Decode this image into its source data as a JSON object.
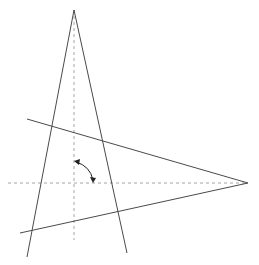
{
  "diagram": {
    "type": "geometric-figure",
    "colors": {
      "solid_line": "#4a4a4a",
      "dashed_line": "#9a9a9a",
      "arrow": "#222222",
      "background": "#ffffff"
    },
    "shapes": {
      "vertical_triangle": {
        "apex": [
          74,
          10
        ],
        "left_base": [
          27,
          257
        ],
        "right_base": [
          127,
          253
        ]
      },
      "horizontal_triangle": {
        "apex": [
          248,
          183
        ],
        "upper_end": [
          27,
          119
        ],
        "lower_end": [
          20,
          233
        ]
      },
      "vertical_axis": {
        "from": [
          74,
          10
        ],
        "to": [
          74,
          240
        ]
      },
      "horizontal_axis": {
        "from": [
          8,
          183
        ],
        "to": [
          248,
          183
        ]
      },
      "rotation_arrow": {
        "from": [
          74,
          161
        ],
        "to": [
          93,
          182
        ],
        "double_headed": true
      }
    },
    "labels": []
  }
}
